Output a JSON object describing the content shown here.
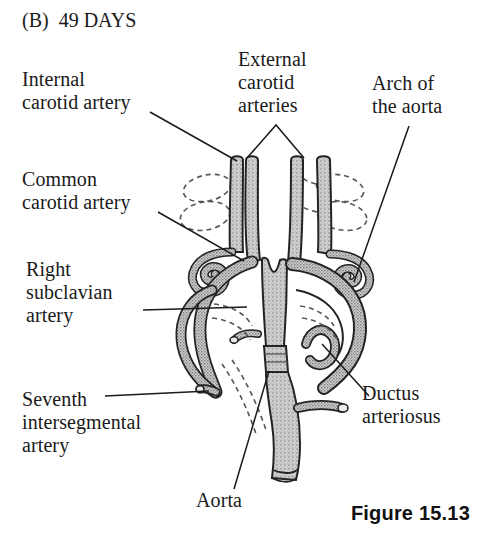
{
  "figure": {
    "panel_letter": "(B)  49 DAYS",
    "caption": "Figure 15.13",
    "background_color": "#ffffff",
    "ink_color": "#1a1a1a",
    "vessel_fill_color": "#c9c9c9",
    "vessel_outline_color": "#232323",
    "regressed_vessel_style": "dashed"
  },
  "labels": {
    "internal_carotid": "Internal\ncarotid artery",
    "external_carotid": "External\ncarotid\narteries",
    "arch_of_aorta": "Arch of\nthe aorta",
    "common_carotid": "Common\ncarotid artery",
    "right_subclavian": "Right\nsubclavian\nartery",
    "seventh_intersegmental": "Seventh\nintersegmental\nartery",
    "ductus_arteriosus": "Ductus\narteriosus",
    "aorta": "Aorta"
  },
  "leader_lines": [
    {
      "name": "internal-carotid-leader",
      "from": [
        150,
        112
      ],
      "to": [
        237,
        161
      ]
    },
    {
      "name": "external-carotid-leader-left",
      "from": [
        276,
        125
      ],
      "to": [
        247,
        158
      ]
    },
    {
      "name": "external-carotid-leader-right",
      "from": [
        276,
        125
      ],
      "to": [
        304,
        158
      ]
    },
    {
      "name": "arch-of-aorta-leader",
      "from": [
        409,
        126
      ],
      "to": [
        354,
        282
      ]
    },
    {
      "name": "common-carotid-leader",
      "from": [
        158,
        212
      ],
      "to": [
        244,
        261
      ]
    },
    {
      "name": "right-subclavian-leader",
      "from": [
        143,
        310
      ],
      "to": [
        247,
        307
      ]
    },
    {
      "name": "seventh-intersegmental-leader",
      "from": [
        105,
        396
      ],
      "to": [
        209,
        391
      ]
    },
    {
      "name": "ductus-arteriosus-leader",
      "from": [
        369,
        396
      ],
      "to": [
        322,
        344
      ]
    },
    {
      "name": "aorta-leader",
      "from": [
        234,
        489
      ],
      "to": [
        269,
        371
      ]
    }
  ],
  "anatomy": {
    "title": "Embryonic aortic arch derivatives at 49 days",
    "structures": [
      "internal carotid artery",
      "external carotid arteries",
      "common carotid artery",
      "right subclavian artery",
      "seventh intersegmental artery",
      "arch of the aorta",
      "ductus arteriosus",
      "aorta"
    ]
  }
}
